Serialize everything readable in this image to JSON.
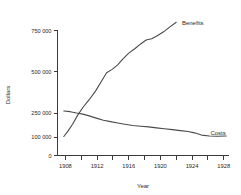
{
  "chart_data": {
    "type": "line",
    "title": "",
    "xlabel": "Year",
    "ylabel": "Dollars",
    "xlim": [
      1907,
      1928.6
    ],
    "ylim": [
      0,
      800000
    ],
    "grid": false,
    "legend_position": "inline-end-of-line",
    "x_ticks_major": [
      1908,
      1912,
      1916,
      1920,
      1924,
      1928
    ],
    "x_ticks_minor": [
      1910,
      1914,
      1918,
      1922,
      1926
    ],
    "x_tick_labels": [
      "1908",
      "1912",
      "1916",
      "1920",
      "1924",
      "1928"
    ],
    "y_ticks": [
      0,
      100000,
      250000,
      500000,
      750000
    ],
    "y_tick_labels": [
      "0",
      "100 000",
      "250 000",
      "500 000",
      "750 000"
    ],
    "y_axis_scale_note": "non-linear spacing between 0 and 250 000",
    "series": [
      {
        "name": "Benefits",
        "label": "Benefits",
        "color": "#4a4a4a",
        "x": [
          1907.8,
          1908.3,
          1908.9,
          1909.5,
          1910.2,
          1911.0,
          1911.8,
          1912.5,
          1913.2,
          1913.9,
          1914.6,
          1915.3,
          1916.0,
          1916.8,
          1917.5,
          1918.2,
          1918.9,
          1919.6,
          1920.4,
          1921.2,
          1922.0
        ],
        "values": [
          103000,
          135000,
          180000,
          232000,
          283000,
          330000,
          382000,
          437000,
          492000,
          513000,
          540000,
          578000,
          612000,
          640000,
          668000,
          692000,
          700000,
          718000,
          742000,
          772000,
          800000
        ]
      },
      {
        "name": "Costs",
        "label": "Costs",
        "color": "#4a4a4a",
        "x": [
          1907.8,
          1908.6,
          1909.4,
          1910.2,
          1911.0,
          1911.9,
          1912.8,
          1913.7,
          1914.6,
          1915.5,
          1916.5,
          1917.5,
          1918.5,
          1919.5,
          1920.5,
          1921.5,
          1922.5,
          1923.5,
          1924.3,
          1925.2,
          1926.2,
          1927.2,
          1928.3
        ],
        "values": [
          262000,
          258000,
          250000,
          243000,
          232000,
          218000,
          205000,
          196000,
          188000,
          180000,
          172000,
          167000,
          163000,
          157000,
          152000,
          146000,
          140000,
          134000,
          126000,
          112000,
          106000,
          105000,
          106000
        ]
      }
    ],
    "annotations": [
      {
        "text": "Benefits",
        "near_x": 1922.4,
        "near_y": 800000
      },
      {
        "text": "Costs",
        "near_x": 1926.0,
        "near_y": 130000
      }
    ]
  }
}
